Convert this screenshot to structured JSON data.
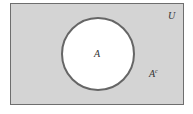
{
  "diagram": {
    "type": "venn",
    "universe_label": "U",
    "set_label": "A",
    "complement_label_base": "A",
    "complement_label_sup": "c",
    "colors": {
      "universe_fill": "#d4d4d4",
      "set_fill": "#ffffff",
      "outline": "#666666"
    }
  }
}
